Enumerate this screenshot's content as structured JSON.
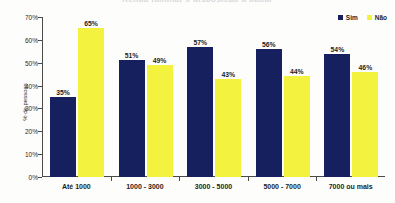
{
  "title": "Renda familiar x disposicao a pagar",
  "legend": {
    "position": "top-right",
    "entries": [
      {
        "label": "Sim",
        "color": "#16205e"
      },
      {
        "label": "Não",
        "color": "#f2f23f"
      }
    ]
  },
  "axes": {
    "ylabel": "% de pessoas",
    "yticks": [
      "0%",
      "10%",
      "20%",
      "30%",
      "40%",
      "50%",
      "60%",
      "70%"
    ]
  },
  "chart_data": {
    "type": "bar",
    "title": "Renda familiar x disposicao a pagar",
    "xlabel": "",
    "ylabel": "% de pessoas",
    "ylim": [
      0,
      70
    ],
    "grid": false,
    "legend_position": "top-right",
    "categories": [
      "Até 1000",
      "1000 - 3000",
      "3000 - 5000",
      "5000 - 7000",
      "7000 ou mais"
    ],
    "series": [
      {
        "name": "Sim",
        "color": "#16205e",
        "values": [
          35,
          51,
          57,
          56,
          54
        ],
        "labels": [
          "35%",
          "51%",
          "57%",
          "56%",
          "54%"
        ]
      },
      {
        "name": "Não",
        "color": "#f2f23f",
        "values": [
          65,
          49,
          43,
          44,
          46
        ],
        "labels": [
          "65%",
          "49%",
          "43%",
          "44%",
          "46%"
        ]
      }
    ]
  }
}
